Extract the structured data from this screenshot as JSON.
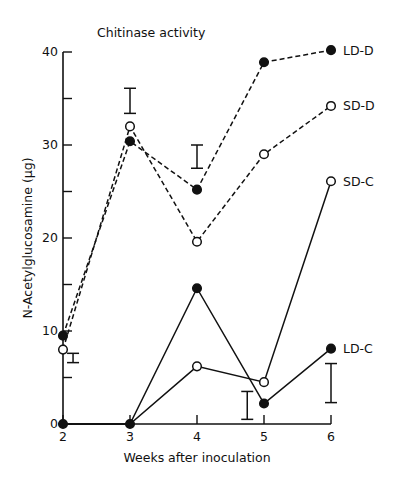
{
  "chart_data": {
    "type": "line",
    "title": "Chitinase activity",
    "xlabel": "Weeks after inoculation",
    "ylabel": "N-Acetylglucosamine (µg)",
    "x": [
      2,
      3,
      4,
      5,
      6
    ],
    "x_ticks": [
      "2",
      "3",
      "4",
      "5",
      "6"
    ],
    "y_ticks": [
      "0",
      "10",
      "20",
      "30",
      "40"
    ],
    "ylim": [
      0,
      40
    ],
    "grid": false,
    "legend_position": "inline-right",
    "series": [
      {
        "name": "LD-D",
        "marker": "filled",
        "line": "dashed",
        "values": [
          9.5,
          30.4,
          25.2,
          38.9,
          40.2
        ]
      },
      {
        "name": "SD-D",
        "marker": "open",
        "line": "dashed",
        "values": [
          8.0,
          32.0,
          19.6,
          29.0,
          34.2
        ]
      },
      {
        "name": "SD-C",
        "marker": "open",
        "line": "solid",
        "values": [
          0,
          0,
          6.2,
          4.5,
          26.1
        ]
      },
      {
        "name": "LD-C",
        "marker": "filled",
        "line": "solid",
        "values": [
          0,
          0,
          14.6,
          2.2,
          8.1
        ]
      }
    ],
    "error_bars": [
      {
        "x": 2.15,
        "low": 6.6,
        "high": 7.6
      },
      {
        "x": 3.0,
        "low": 33.4,
        "high": 36.1
      },
      {
        "x": 4.0,
        "low": 27.5,
        "high": 30.0
      },
      {
        "x": 4.75,
        "low": 0.5,
        "high": 3.5
      },
      {
        "x": 6.0,
        "low": 2.3,
        "high": 6.5
      }
    ]
  }
}
